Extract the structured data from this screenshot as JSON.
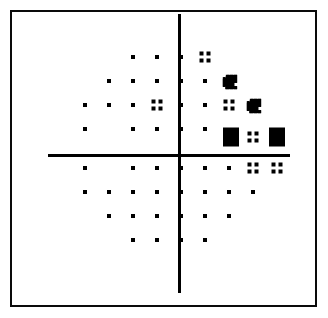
{
  "plot": {
    "title": "Visual Field Probability Plot",
    "frame": {
      "x": 10,
      "y": 10,
      "width": 307,
      "height": 297,
      "border_color": "#0a0a0a",
      "border_width": 2
    },
    "background_color": "#ffffff",
    "symbol_color": "#000000",
    "vertical_axis": {
      "x": 179,
      "y_start": 14,
      "y_end": 293,
      "thickness": 3
    },
    "horizontal_axis": {
      "y": 155,
      "x_start": 48,
      "x_end": 290,
      "thickness": 3
    },
    "grid": {
      "column_x": [
        85,
        109,
        133,
        157,
        181,
        205,
        229,
        253,
        277
      ],
      "row_y": [
        57,
        81,
        105,
        129,
        168,
        192,
        216,
        240
      ],
      "column_spacing": 24,
      "row_spacing": 24
    },
    "legend": {
      "dot": "within normal limits",
      "quad": "p < 5%",
      "dense": "p < 1%",
      "solid": "p < 0.5%"
    }
  },
  "chart_data": {
    "type": "scatter",
    "xlabel": "",
    "ylabel": "",
    "grid": false,
    "legend": "none",
    "symbol_legend": [
      {
        "key": "dot",
        "label": "within normal limits",
        "rank": 0
      },
      {
        "key": "quad",
        "label": "p < 5%",
        "rank": 1
      },
      {
        "key": "dense",
        "label": "p < 1%",
        "rank": 2
      },
      {
        "key": "solid",
        "label": "p < 0.5%",
        "rank": 3
      }
    ],
    "x": [
      85,
      109,
      133,
      157,
      181,
      205,
      229,
      253,
      277
    ],
    "y": [
      57,
      81,
      105,
      129,
      168,
      192,
      216,
      240
    ],
    "points": [
      {
        "x": 133,
        "y": 57,
        "symbol": "dot"
      },
      {
        "x": 157,
        "y": 57,
        "symbol": "dot"
      },
      {
        "x": 181,
        "y": 57,
        "symbol": "dot"
      },
      {
        "x": 205,
        "y": 57,
        "symbol": "quad"
      },
      {
        "x": 109,
        "y": 81,
        "symbol": "dot"
      },
      {
        "x": 133,
        "y": 81,
        "symbol": "dot"
      },
      {
        "x": 157,
        "y": 81,
        "symbol": "dot"
      },
      {
        "x": 181,
        "y": 81,
        "symbol": "dot"
      },
      {
        "x": 205,
        "y": 81,
        "symbol": "dot"
      },
      {
        "x": 230,
        "y": 82,
        "symbol": "dense"
      },
      {
        "x": 85,
        "y": 105,
        "symbol": "dot"
      },
      {
        "x": 109,
        "y": 105,
        "symbol": "dot"
      },
      {
        "x": 133,
        "y": 105,
        "symbol": "dot"
      },
      {
        "x": 157,
        "y": 105,
        "symbol": "quad"
      },
      {
        "x": 181,
        "y": 105,
        "symbol": "dot"
      },
      {
        "x": 205,
        "y": 105,
        "symbol": "dot"
      },
      {
        "x": 229,
        "y": 105,
        "symbol": "quad"
      },
      {
        "x": 254,
        "y": 106,
        "symbol": "dense"
      },
      {
        "x": 85,
        "y": 129,
        "symbol": "dot"
      },
      {
        "x": 133,
        "y": 129,
        "symbol": "dot"
      },
      {
        "x": 157,
        "y": 129,
        "symbol": "dot"
      },
      {
        "x": 181,
        "y": 129,
        "symbol": "dot"
      },
      {
        "x": 205,
        "y": 129,
        "symbol": "dot"
      },
      {
        "x": 231,
        "y": 137,
        "symbol": "solid"
      },
      {
        "x": 253,
        "y": 137,
        "symbol": "quad"
      },
      {
        "x": 277,
        "y": 137,
        "symbol": "solid"
      },
      {
        "x": 85,
        "y": 168,
        "symbol": "dot"
      },
      {
        "x": 133,
        "y": 168,
        "symbol": "dot"
      },
      {
        "x": 157,
        "y": 168,
        "symbol": "dot"
      },
      {
        "x": 181,
        "y": 168,
        "symbol": "dot"
      },
      {
        "x": 205,
        "y": 168,
        "symbol": "dot"
      },
      {
        "x": 229,
        "y": 168,
        "symbol": "dot"
      },
      {
        "x": 253,
        "y": 168,
        "symbol": "quad"
      },
      {
        "x": 277,
        "y": 168,
        "symbol": "quad"
      },
      {
        "x": 85,
        "y": 192,
        "symbol": "dot"
      },
      {
        "x": 109,
        "y": 192,
        "symbol": "dot"
      },
      {
        "x": 133,
        "y": 192,
        "symbol": "dot"
      },
      {
        "x": 157,
        "y": 192,
        "symbol": "dot"
      },
      {
        "x": 181,
        "y": 192,
        "symbol": "dot"
      },
      {
        "x": 205,
        "y": 192,
        "symbol": "dot"
      },
      {
        "x": 229,
        "y": 192,
        "symbol": "dot"
      },
      {
        "x": 253,
        "y": 192,
        "symbol": "dot"
      },
      {
        "x": 109,
        "y": 216,
        "symbol": "dot"
      },
      {
        "x": 133,
        "y": 216,
        "symbol": "dot"
      },
      {
        "x": 157,
        "y": 216,
        "symbol": "dot"
      },
      {
        "x": 181,
        "y": 216,
        "symbol": "dot"
      },
      {
        "x": 205,
        "y": 216,
        "symbol": "dot"
      },
      {
        "x": 229,
        "y": 216,
        "symbol": "dot"
      },
      {
        "x": 133,
        "y": 240,
        "symbol": "dot"
      },
      {
        "x": 157,
        "y": 240,
        "symbol": "dot"
      },
      {
        "x": 181,
        "y": 240,
        "symbol": "dot"
      },
      {
        "x": 205,
        "y": 240,
        "symbol": "dot"
      }
    ]
  }
}
